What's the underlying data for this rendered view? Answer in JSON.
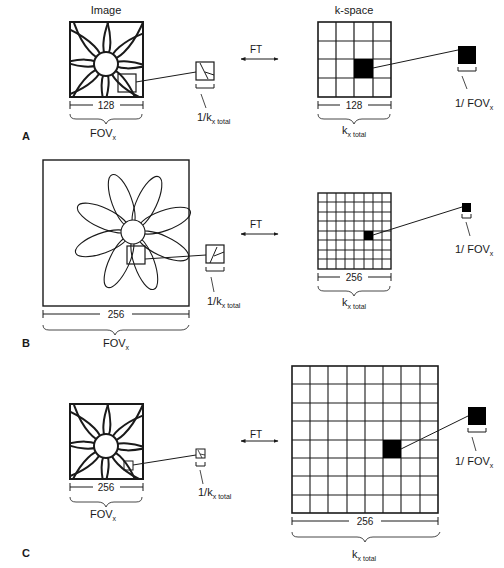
{
  "headers": {
    "image": "Image",
    "kspace": "k-space"
  },
  "transform_label": "FT",
  "panels": [
    {
      "letter": "A",
      "image_width_label": "128",
      "fov_label": "FOV",
      "fov_sub": "x",
      "pixel_label": "1/k",
      "pixel_sub": "x total",
      "kspace_width_label": "128",
      "ktotal_label": "k",
      "ktotal_sub": "x total",
      "kstep_label": "1/ FOV",
      "kstep_sub": "x",
      "kspace_grid": 4
    },
    {
      "letter": "B",
      "image_width_label": "256",
      "fov_label": "FOV",
      "fov_sub": "x",
      "pixel_label": "1/k",
      "pixel_sub": "x total",
      "kspace_width_label": "256",
      "ktotal_label": "k",
      "ktotal_sub": "x total",
      "kstep_label": "1/ FOV",
      "kstep_sub": "x",
      "kspace_grid": 8
    },
    {
      "letter": "C",
      "image_width_label": "256",
      "fov_label": "FOV",
      "fov_sub": "x",
      "pixel_label": "1/k",
      "pixel_sub": "x total",
      "kspace_width_label": "256",
      "ktotal_label": "k",
      "ktotal_sub": "x total",
      "kstep_label": "1/ FOV",
      "kstep_sub": "x",
      "kspace_grid": 8
    }
  ]
}
